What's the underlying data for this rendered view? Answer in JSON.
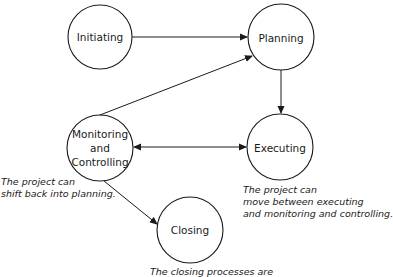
{
  "nodes": {
    "initiating": {
      "label": "Initiating"
    },
    "planning": {
      "label": "Planning"
    },
    "monitoring": {
      "line1": "Monitoring",
      "line2": "and",
      "line3": "Controlling"
    },
    "executing": {
      "label": "Executing"
    },
    "closing": {
      "label": "Closing"
    }
  },
  "notes": {
    "monitoring_note": {
      "line1": "The project can",
      "line2": "shift back into planning."
    },
    "executing_note": {
      "line1": "The project can",
      "line2": "move between executing",
      "line3": "and monitoring and controlling."
    },
    "closing_note": {
      "line1": "The closing processes are"
    }
  },
  "colors": {
    "stroke": "#1a1a1a",
    "background": "#ffffff"
  }
}
